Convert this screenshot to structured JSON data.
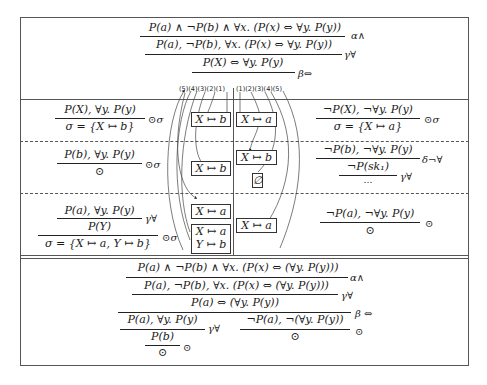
{
  "top_section": {
    "line1": "P(a) ∧ ¬P(b) ∧ ∀x. (P(x) ⇔ ∀y. P(y))",
    "rule1": "α∧",
    "line2": "P(a), ¬P(b), ∀x. (P(x) ⇔ ∀y. P(y))",
    "rule2": "γ∀",
    "line3": "P(X) ⇔ ∀y. P(y)",
    "rule3": "β⇔"
  },
  "branch_numbers": {
    "left": "(5)(4)(3)(2)(1)",
    "right": "(1)(2)(3)(4)(5)"
  },
  "left_column": [
    {
      "premise": "P(X), ∀y. P(y)",
      "conclusion": "σ = {X ↦ b}",
      "rule": "⊙σ"
    },
    {
      "premise": "P(b), ∀y. P(y)",
      "conclusion": "⊙",
      "rule": "⊙σ"
    },
    {
      "premise": "P(a), ∀y. P(y)",
      "middle": "P(Y)",
      "middle_rule": "γ∀",
      "conclusion": "σ = {X ↦ a, Y ↦ b}",
      "rule": "⊙σ"
    }
  ],
  "right_column": [
    {
      "premise": "¬P(X), ¬∀y. P(y)",
      "conclusion": "σ = {X ↦ a}",
      "rule": "⊙σ"
    },
    {
      "premise": "¬P(b), ¬∀y. P(y)",
      "middle": "¬P(sk₁)",
      "middle_rule": "δ¬∀",
      "conclusion": "…",
      "rule": "γ∀"
    },
    {
      "premise": "¬P(a), ¬∀y. P(y)",
      "conclusion": "⊙",
      "rule": "⊙"
    }
  ],
  "substitution_boxes": {
    "left": [
      "X ↦ b",
      "X ↦ b",
      "X ↦ a",
      "X ↦ a",
      "Y ↦ b"
    ],
    "right": [
      "X ↦ a",
      "X ↦ b",
      "∅",
      "X ↦ a"
    ]
  },
  "bottom_section": {
    "line1": "P(a) ∧ ¬P(b) ∧ ∀x. (P(x) ⇔ (∀y. P(y)))",
    "rule1": "α∧",
    "line2": "P(a), ¬P(b), ∀x. (P(x) ⇔ (∀y. P(y)))",
    "rule2": "γ∀",
    "line3": "P(a) ⇔ (∀y. P(y))",
    "rule3": "β ⇔",
    "left_branch": {
      "premise": "P(a), ∀y. P(y)",
      "rule": "γ∀",
      "middle": "P(b)",
      "conclusion": "⊙",
      "close_rule": "⊙"
    },
    "right_branch": {
      "premise": "¬P(a), ¬(∀y. P(y))",
      "conclusion": "⊙",
      "rule": "⊙"
    }
  }
}
